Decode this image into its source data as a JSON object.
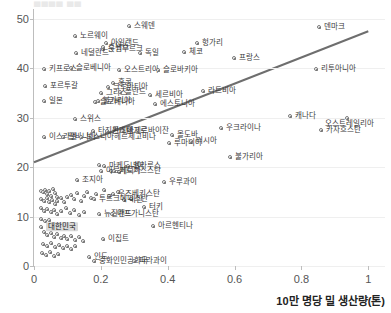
{
  "clipped_title": "▄▄▄▄ ▄▄",
  "axis": {
    "x_label": "10만 명당 밀 생산량(톤)",
    "y_label": "",
    "x_ticks": [
      "0",
      "0.2",
      "0.4",
      "0.6",
      "0.8",
      "1"
    ],
    "y_ticks": [
      "0",
      "10",
      "20",
      "30",
      "40",
      "50"
    ]
  },
  "chart_data": {
    "type": "scatter",
    "title": "",
    "xlabel": "10만 명당 밀 생산량(톤)",
    "ylabel": "",
    "xlim": [
      0,
      1.05
    ],
    "ylim": [
      0,
      52
    ],
    "grid": true,
    "legend": "none",
    "highlight": "대한민국",
    "trendline": {
      "x0": 0.0,
      "y0": 21.0,
      "x1": 1.0,
      "y1": 47.5,
      "color": "#6e6e6e"
    },
    "points": [
      {
        "label": "스웨덴",
        "x": 0.283,
        "y": 48.6,
        "lx": 5,
        "ly": 0
      },
      {
        "label": "노르웨이",
        "x": 0.122,
        "y": 46.5,
        "lx": 5,
        "ly": 0
      },
      {
        "label": "아일랜드",
        "x": 0.214,
        "y": 45.1,
        "lx": 5,
        "ly": 0
      },
      {
        "label": "룭셈부르크",
        "x": 0.207,
        "y": 44.0,
        "lx": 5,
        "ly": 0
      },
      {
        "label": "스위스",
        "x": 0.206,
        "y": 44.4,
        "lx": 5,
        "ly": 0
      },
      {
        "label": "네덜란드",
        "x": 0.125,
        "y": 43.1,
        "lx": 5,
        "ly": 0
      },
      {
        "label": "독일",
        "x": 0.316,
        "y": 43.0,
        "lx": 5,
        "ly": 0
      },
      {
        "label": "덴마크",
        "x": 0.853,
        "y": 48.3,
        "lx": 5,
        "ly": 0
      },
      {
        "label": "헝가리",
        "x": 0.487,
        "y": 45.2,
        "lx": 5,
        "ly": 0
      },
      {
        "label": "체코",
        "x": 0.45,
        "y": 43.3,
        "lx": 5,
        "ly": 0
      },
      {
        "label": "프랑스",
        "x": 0.597,
        "y": 42.0,
        "lx": 5,
        "ly": 0
      },
      {
        "label": "키프로스",
        "x": 0.031,
        "y": 39.8,
        "lx": 5,
        "ly": 0
      },
      {
        "label": "슬로베니아",
        "x": 0.112,
        "y": 40.0,
        "lx": 5,
        "ly": 0
      },
      {
        "label": "오스트리아",
        "x": 0.253,
        "y": 39.7,
        "lx": 5,
        "ly": 0
      },
      {
        "label": "슬로바키아",
        "x": 0.37,
        "y": 39.6,
        "lx": 5,
        "ly": 0
      },
      {
        "label": "리투아니아",
        "x": 0.845,
        "y": 39.8,
        "lx": 5,
        "ly": 0
      },
      {
        "label": "라트비아",
        "x": 0.505,
        "y": 35.4,
        "lx": 5,
        "ly": 0
      },
      {
        "label": "포르투갈",
        "x": 0.033,
        "y": 36.4,
        "lx": 5,
        "ly": 0
      },
      {
        "label": "홍콩",
        "x": 0.236,
        "y": 37.0,
        "lx": 5,
        "ly": 0
      },
      {
        "label": "크로아티아",
        "x": 0.222,
        "y": 36.2,
        "lx": 5,
        "ly": 0
      },
      {
        "label": "그리스",
        "x": 0.199,
        "y": 35.1,
        "lx": 5,
        "ly": 0
      },
      {
        "label": "폴란드",
        "x": 0.258,
        "y": 35.3,
        "lx": 5,
        "ly": 0
      },
      {
        "label": "세르비아",
        "x": 0.348,
        "y": 34.7,
        "lx": 5,
        "ly": 0
      },
      {
        "label": "에스토니아",
        "x": 0.361,
        "y": 32.8,
        "lx": 5,
        "ly": 0
      },
      {
        "label": "일본",
        "x": 0.03,
        "y": 33.4,
        "lx": 5,
        "ly": 0
      },
      {
        "label": "슬로베니아",
        "x": 0.182,
        "y": 33.2,
        "lx": 5,
        "ly": 0
      },
      {
        "label": "불가리아",
        "x": 0.19,
        "y": 33.4,
        "lx": 5,
        "ly": 0
      },
      {
        "label": "캐나다",
        "x": 0.766,
        "y": 30.3,
        "lx": 5,
        "ly": 0
      },
      {
        "label": "오스트레일리아",
        "x": 0.935,
        "y": 29.9,
        "lx": -22,
        "ly": 6
      },
      {
        "label": "카자흐스탄",
        "x": 0.86,
        "y": 27.6,
        "lx": 5,
        "ly": 0
      },
      {
        "label": "스위스",
        "x": 0.124,
        "y": 29.8,
        "lx": 5,
        "ly": 0
      },
      {
        "label": "타지키스탄",
        "x": 0.176,
        "y": 27.3,
        "lx": 5,
        "ly": 0
      },
      {
        "label": "몬테네그로",
        "x": 0.218,
        "y": 27.3,
        "lx": 5,
        "ly": 0
      },
      {
        "label": "아제르바이잔",
        "x": 0.262,
        "y": 27.3,
        "lx": 5,
        "ly": 0
      },
      {
        "label": "이스라엘",
        "x": 0.03,
        "y": 26.2,
        "lx": 5,
        "ly": 0
      },
      {
        "label": "알바니아",
        "x": 0.086,
        "y": 26.2,
        "lx": 5,
        "ly": 0
      },
      {
        "label": "보스니아헤르체고비나",
        "x": 0.14,
        "y": 26.2,
        "lx": 5,
        "ly": 0
      },
      {
        "label": "몰도바",
        "x": 0.414,
        "y": 26.6,
        "lx": 5,
        "ly": 0
      },
      {
        "label": "루마니아",
        "x": 0.403,
        "y": 24.8,
        "lx": 5,
        "ly": 0
      },
      {
        "label": "러시아",
        "x": 0.47,
        "y": 25.2,
        "lx": 5,
        "ly": 0
      },
      {
        "label": "우크라이나",
        "x": 0.56,
        "y": 27.9,
        "lx": 5,
        "ly": 0
      },
      {
        "label": "불가리아",
        "x": 0.585,
        "y": 22.0,
        "lx": 5,
        "ly": 0
      },
      {
        "label": "우루과이",
        "x": 0.389,
        "y": 17.0,
        "lx": 5,
        "ly": 0
      },
      {
        "label": "마케도니아",
        "x": 0.208,
        "y": 20.3,
        "lx": 5,
        "ly": 0
      },
      {
        "label": "벨라루스",
        "x": 0.28,
        "y": 20.3,
        "lx": 5,
        "ly": 0
      },
      {
        "label": "아르메니아",
        "x": 0.2,
        "y": 19.2,
        "lx": 5,
        "ly": 0
      },
      {
        "label": "키르기스스탄",
        "x": 0.238,
        "y": 19.2,
        "lx": 5,
        "ly": 0
      },
      {
        "label": "조지아",
        "x": 0.128,
        "y": 17.3,
        "lx": 5,
        "ly": 0
      },
      {
        "label": "우즈베키스탄",
        "x": 0.236,
        "y": 14.6,
        "lx": 5,
        "ly": 0
      },
      {
        "label": "이란",
        "x": 0.27,
        "y": 13.4,
        "lx": 5,
        "ly": 0
      },
      {
        "label": "투르크메니스탄",
        "x": 0.18,
        "y": 13.6,
        "lx": 5,
        "ly": 0
      },
      {
        "label": "터키",
        "x": 0.33,
        "y": 11.9,
        "lx": 5,
        "ly": 0
      },
      {
        "label": "뉴질랜드",
        "x": 0.194,
        "y": 10.6,
        "lx": 5,
        "ly": 0
      },
      {
        "label": "아프가니스탄",
        "x": 0.232,
        "y": 10.6,
        "lx": 5,
        "ly": 0
      },
      {
        "label": "아르헨티나",
        "x": 0.355,
        "y": 8.1,
        "lx": 5,
        "ly": 0
      },
      {
        "label": "대한민국",
        "x": 0.022,
        "y": 7.9,
        "lx": 5,
        "ly": 0,
        "highlight": true
      },
      {
        "label": "이집트",
        "x": 0.205,
        "y": 5.5,
        "lx": 5,
        "ly": 0
      },
      {
        "label": "인도",
        "x": 0.165,
        "y": 1.8,
        "lx": 5,
        "ly": 0
      },
      {
        "label": "중화인민공화국",
        "x": 0.178,
        "y": 1.0,
        "lx": 5,
        "ly": 0
      },
      {
        "label": "파라과이",
        "x": 0.3,
        "y": 1.0,
        "lx": 5,
        "ly": 0
      }
    ],
    "cluster_points": [
      {
        "x": 0.02,
        "y": 15.2
      },
      {
        "x": 0.028,
        "y": 14.9
      },
      {
        "x": 0.034,
        "y": 15.4
      },
      {
        "x": 0.04,
        "y": 14.5
      },
      {
        "x": 0.046,
        "y": 15.1
      },
      {
        "x": 0.052,
        "y": 14.2
      },
      {
        "x": 0.058,
        "y": 15.6
      },
      {
        "x": 0.064,
        "y": 14.8
      },
      {
        "x": 0.07,
        "y": 13.9
      },
      {
        "x": 0.022,
        "y": 13.6
      },
      {
        "x": 0.03,
        "y": 13.2
      },
      {
        "x": 0.038,
        "y": 13.8
      },
      {
        "x": 0.046,
        "y": 12.9
      },
      {
        "x": 0.054,
        "y": 13.4
      },
      {
        "x": 0.062,
        "y": 12.6
      },
      {
        "x": 0.07,
        "y": 13.1
      },
      {
        "x": 0.08,
        "y": 13.7
      },
      {
        "x": 0.09,
        "y": 13.0
      },
      {
        "x": 0.1,
        "y": 14.0
      },
      {
        "x": 0.11,
        "y": 14.4
      },
      {
        "x": 0.12,
        "y": 13.5
      },
      {
        "x": 0.13,
        "y": 14.8
      },
      {
        "x": 0.14,
        "y": 13.2
      },
      {
        "x": 0.15,
        "y": 14.1
      },
      {
        "x": 0.16,
        "y": 15.0
      },
      {
        "x": 0.17,
        "y": 13.8
      },
      {
        "x": 0.185,
        "y": 14.6
      },
      {
        "x": 0.02,
        "y": 11.8
      },
      {
        "x": 0.03,
        "y": 11.2
      },
      {
        "x": 0.04,
        "y": 11.6
      },
      {
        "x": 0.05,
        "y": 10.9
      },
      {
        "x": 0.06,
        "y": 11.4
      },
      {
        "x": 0.07,
        "y": 10.5
      },
      {
        "x": 0.08,
        "y": 11.1
      },
      {
        "x": 0.095,
        "y": 11.7
      },
      {
        "x": 0.108,
        "y": 10.8
      },
      {
        "x": 0.12,
        "y": 11.3
      },
      {
        "x": 0.135,
        "y": 10.4
      },
      {
        "x": 0.15,
        "y": 11.0
      },
      {
        "x": 0.022,
        "y": 9.6
      },
      {
        "x": 0.032,
        "y": 9.1
      },
      {
        "x": 0.044,
        "y": 9.4
      },
      {
        "x": 0.03,
        "y": 6.8
      },
      {
        "x": 0.04,
        "y": 6.2
      },
      {
        "x": 0.05,
        "y": 6.6
      },
      {
        "x": 0.06,
        "y": 5.9
      },
      {
        "x": 0.07,
        "y": 6.4
      },
      {
        "x": 0.08,
        "y": 5.6
      },
      {
        "x": 0.09,
        "y": 6.1
      },
      {
        "x": 0.1,
        "y": 5.4
      },
      {
        "x": 0.112,
        "y": 6.0
      },
      {
        "x": 0.124,
        "y": 5.2
      },
      {
        "x": 0.136,
        "y": 5.8
      },
      {
        "x": 0.148,
        "y": 5.0
      },
      {
        "x": 0.026,
        "y": 4.4
      },
      {
        "x": 0.038,
        "y": 4.0
      },
      {
        "x": 0.05,
        "y": 4.6
      },
      {
        "x": 0.062,
        "y": 3.9
      },
      {
        "x": 0.074,
        "y": 4.3
      },
      {
        "x": 0.086,
        "y": 3.6
      },
      {
        "x": 0.098,
        "y": 4.1
      },
      {
        "x": 0.11,
        "y": 3.4
      },
      {
        "x": 0.122,
        "y": 4.0
      },
      {
        "x": 0.024,
        "y": 2.6
      },
      {
        "x": 0.036,
        "y": 2.2
      },
      {
        "x": 0.048,
        "y": 2.8
      },
      {
        "x": 0.06,
        "y": 2.1
      },
      {
        "x": 0.072,
        "y": 2.5
      },
      {
        "x": 0.21,
        "y": 15.3
      },
      {
        "x": 0.225,
        "y": 14.2
      },
      {
        "x": 0.25,
        "y": 14.9
      },
      {
        "x": 0.29,
        "y": 13.6
      },
      {
        "x": 0.195,
        "y": 20.4
      },
      {
        "x": 0.23,
        "y": 19.3
      },
      {
        "x": 0.255,
        "y": 19.1
      }
    ]
  }
}
